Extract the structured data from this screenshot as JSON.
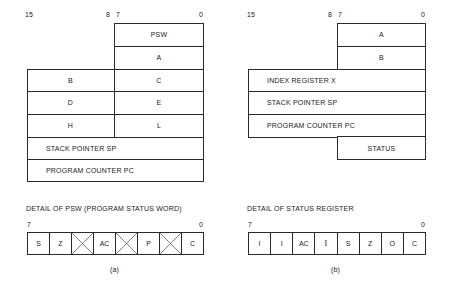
{
  "diagram_a": {
    "bit_labels": {
      "high": "15",
      "mid_hi": "8",
      "mid_lo": "7",
      "low": "0"
    },
    "byte_registers": [
      {
        "label": "PSW"
      },
      {
        "label": "A"
      }
    ],
    "register_pairs": [
      {
        "high": "B",
        "low": "C"
      },
      {
        "high": "D",
        "low": "E"
      },
      {
        "high": "H",
        "low": "L"
      }
    ],
    "word_registers": [
      {
        "label": "STACK POINTER SP"
      },
      {
        "label": "PROGRAM COUNTER PC"
      }
    ],
    "detail": {
      "title": "DETAIL OF PSW (PROGRAM STATUS WORD)",
      "bit_high": "7",
      "bit_low": "0",
      "bits": [
        {
          "label": "S",
          "unused": false
        },
        {
          "label": "Z",
          "unused": false
        },
        {
          "label": "",
          "unused": true
        },
        {
          "label": "AC",
          "unused": false
        },
        {
          "label": "",
          "unused": true
        },
        {
          "label": "P",
          "unused": false
        },
        {
          "label": "",
          "unused": true
        },
        {
          "label": "C",
          "unused": false
        }
      ]
    },
    "caption": "(a)"
  },
  "diagram_b": {
    "bit_labels": {
      "high": "15",
      "mid_hi": "8",
      "mid_lo": "7",
      "low": "0"
    },
    "byte_registers": [
      {
        "label": "A"
      },
      {
        "label": "B"
      }
    ],
    "word_registers": [
      {
        "label": "INDEX REGISTER X"
      },
      {
        "label": "STACK POINTER SP"
      },
      {
        "label": "PROGRAM COUNTER PC"
      }
    ],
    "status_register": {
      "label": "STATUS"
    },
    "detail": {
      "title": "DETAIL OF STATUS REGISTER",
      "bit_high": "7",
      "bit_low": "0",
      "bits": [
        {
          "label": "I"
        },
        {
          "label": "I"
        },
        {
          "label": "AC"
        },
        {
          "label": "I"
        },
        {
          "label": "S"
        },
        {
          "label": "Z"
        },
        {
          "label": "O"
        },
        {
          "label": "C"
        }
      ]
    },
    "caption": "(b)"
  }
}
